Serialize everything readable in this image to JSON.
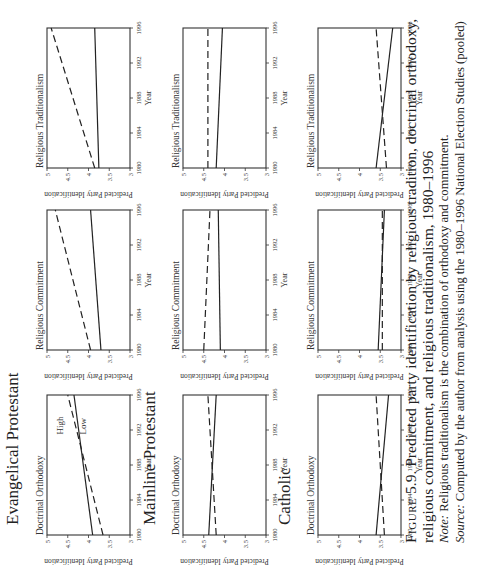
{
  "figure": {
    "label": "Figure 5.9.",
    "label_prefix": "Figure",
    "label_number": "5.9.",
    "title_line1": "Predicted party identification by religious tradition, doctrinal orthodoxy,",
    "title_line2": "religious commitment, and religious traditionalism, 1980–1996",
    "note_label": "Note:",
    "note_text": "Religious traditionalism is the combination of orthodoxy and commitment.",
    "source_label": "Source:",
    "source_text": "Computed by the author from analysis using the 1980–1996 National Election Studies (pooled)"
  },
  "groups": [
    {
      "title": "Evangelical Protestant"
    },
    {
      "title": "Mainline Protestant"
    },
    {
      "title": "Catholic"
    }
  ],
  "axis": {
    "ylabel": "Predicted Party Identification",
    "xlabel": "Year",
    "yticks": [
      "3",
      "3.5",
      "4",
      "4.5",
      "5"
    ],
    "xticks": [
      "1980",
      "1984",
      "1988",
      "1992",
      "1996"
    ]
  },
  "line_labels": {
    "high": "High",
    "low": "Low"
  },
  "chart_data": [
    {
      "type": "line",
      "group": "Evangelical Protestant",
      "title": "Doctrinal Orthodoxy",
      "xlabel": "Year",
      "ylabel": "Predicted Party Identification",
      "xlim": [
        1980,
        1996
      ],
      "ylim": [
        3,
        5
      ],
      "x": [
        1980,
        1996
      ],
      "series": [
        {
          "name": "High",
          "style": "dashed",
          "values": [
            3.65,
            4.5
          ]
        },
        {
          "name": "Low",
          "style": "solid",
          "values": [
            3.9,
            4.35
          ]
        }
      ],
      "annotations": [
        "High",
        "Low"
      ]
    },
    {
      "type": "line",
      "group": "Evangelical Protestant",
      "title": "Religious Commitment",
      "xlabel": "Year",
      "ylabel": "Predicted Party Identification",
      "xlim": [
        1980,
        1996
      ],
      "ylim": [
        3,
        5
      ],
      "x": [
        1980,
        1996
      ],
      "series": [
        {
          "name": "High",
          "style": "dashed",
          "values": [
            3.95,
            4.8
          ]
        },
        {
          "name": "Low",
          "style": "solid",
          "values": [
            3.7,
            3.95
          ]
        }
      ]
    },
    {
      "type": "line",
      "group": "Evangelical Protestant",
      "title": "Religious Traditionalism",
      "xlabel": "Year",
      "ylabel": "Predicted Party Identification",
      "xlim": [
        1980,
        1996
      ],
      "ylim": [
        3,
        5
      ],
      "x": [
        1980,
        1996
      ],
      "series": [
        {
          "name": "High",
          "style": "dashed",
          "values": [
            3.85,
            4.9
          ]
        },
        {
          "name": "Low",
          "style": "solid",
          "values": [
            3.75,
            3.85
          ]
        }
      ]
    },
    {
      "type": "line",
      "group": "Mainline Protestant",
      "title": "Doctrinal Orthodoxy",
      "xlabel": "Year",
      "ylabel": "Predicted Party Identification",
      "xlim": [
        1980,
        1996
      ],
      "ylim": [
        3,
        5
      ],
      "x": [
        1980,
        1996
      ],
      "series": [
        {
          "name": "High",
          "style": "dashed",
          "values": [
            4.2,
            4.4
          ]
        },
        {
          "name": "Low",
          "style": "solid",
          "values": [
            4.38,
            4.2
          ]
        }
      ]
    },
    {
      "type": "line",
      "group": "Mainline Protestant",
      "title": "Religious Commitment",
      "xlabel": "Year",
      "ylabel": "Predicted Party Identification",
      "xlim": [
        1980,
        1996
      ],
      "ylim": [
        3,
        5
      ],
      "x": [
        1980,
        1996
      ],
      "series": [
        {
          "name": "High",
          "style": "dashed",
          "values": [
            4.5,
            4.35
          ]
        },
        {
          "name": "Low",
          "style": "solid",
          "values": [
            4.1,
            4.15
          ]
        }
      ]
    },
    {
      "type": "line",
      "group": "Mainline Protestant",
      "title": "Religious Traditionalism",
      "xlabel": "Year",
      "ylabel": "Predicted Party Identification",
      "xlim": [
        1980,
        1996
      ],
      "ylim": [
        3,
        5
      ],
      "x": [
        1980,
        1996
      ],
      "series": [
        {
          "name": "High",
          "style": "dashed",
          "values": [
            4.4,
            4.4
          ]
        },
        {
          "name": "Low",
          "style": "solid",
          "values": [
            4.2,
            4.05
          ]
        }
      ]
    },
    {
      "type": "line",
      "group": "Catholic",
      "title": "Doctrinal Orthodoxy",
      "xlabel": "Year",
      "ylabel": "Predicted Party Identification",
      "xlim": [
        1980,
        1996
      ],
      "ylim": [
        3,
        5
      ],
      "x": [
        1980,
        1996
      ],
      "series": [
        {
          "name": "High",
          "style": "dashed",
          "values": [
            3.4,
            3.6
          ]
        },
        {
          "name": "Low",
          "style": "solid",
          "values": [
            3.6,
            3.3
          ]
        }
      ]
    },
    {
      "type": "line",
      "group": "Catholic",
      "title": "Religious Commitment",
      "xlabel": "Year",
      "ylabel": "Predicted Party Identification",
      "xlim": [
        1980,
        1996
      ],
      "ylim": [
        3,
        5
      ],
      "x": [
        1980,
        1996
      ],
      "series": [
        {
          "name": "High",
          "style": "dashed",
          "values": [
            3.45,
            3.45
          ]
        },
        {
          "name": "Low",
          "style": "solid",
          "values": [
            3.55,
            3.4
          ]
        }
      ]
    },
    {
      "type": "line",
      "group": "Catholic",
      "title": "Religious Traditionalism",
      "xlabel": "Year",
      "ylabel": "Predicted Party Identification",
      "xlim": [
        1980,
        1996
      ],
      "ylim": [
        3,
        5
      ],
      "x": [
        1980,
        1996
      ],
      "series": [
        {
          "name": "High",
          "style": "dashed",
          "values": [
            3.35,
            3.6
          ]
        },
        {
          "name": "Low",
          "style": "solid",
          "values": [
            3.6,
            3.2
          ]
        }
      ]
    }
  ]
}
